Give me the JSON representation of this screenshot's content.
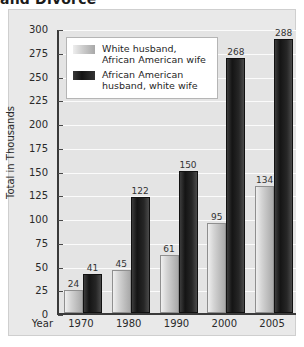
{
  "title": {
    "text": "and Divorce",
    "note": "cut-off-top"
  },
  "axes": {
    "y_label": "Total in Thousands",
    "x_label": "Year",
    "y_ticks": [
      "0",
      "25",
      "50",
      "75",
      "100",
      "125",
      "150",
      "175",
      "200",
      "225",
      "250",
      "275",
      "300"
    ]
  },
  "legend": {
    "items": [
      {
        "label": "White husband,\nAfrican American wife",
        "swatch": "light",
        "color": "#c9c9c9"
      },
      {
        "label": "African American\nhusband, white wife",
        "swatch": "dark",
        "color": "#1a1a1a"
      }
    ]
  },
  "chart_data": {
    "type": "bar",
    "title": "and Divorce",
    "xlabel": "Year",
    "ylabel": "Total in Thousands",
    "ylim": [
      0,
      300
    ],
    "ytick_step": 25,
    "grid": true,
    "legend_position": "top-left-inside",
    "categories": [
      "1970",
      "1980",
      "1990",
      "2000",
      "2005"
    ],
    "series": [
      {
        "name": "White husband, African American wife",
        "color": "#c9c9c9",
        "values": [
          24,
          45,
          61,
          95,
          134
        ]
      },
      {
        "name": "African American husband, white wife",
        "color": "#1a1a1a",
        "values": [
          41,
          122,
          150,
          268,
          288
        ]
      }
    ],
    "data_labels": [
      "24",
      "41",
      "45",
      "122",
      "61",
      "150",
      "95",
      "268",
      "134",
      "288"
    ]
  }
}
